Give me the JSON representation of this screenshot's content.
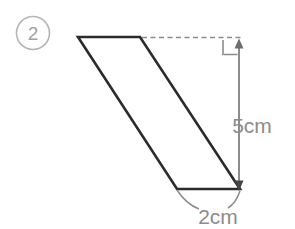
{
  "figure": {
    "problem_marker": "2",
    "shape_name": "parallelogram",
    "height_label": "5cm",
    "base_label": "2cm",
    "colors": {
      "shape_stroke": "#2b2b2b",
      "dimension_line": "#8c8c8c",
      "dashed_guide": "#8c8c8c",
      "label_text": "#8c8c8c",
      "marker_text": "#a0a0a0",
      "background": "#ffffff"
    },
    "geometry": {
      "top_left": [
        78,
        37
      ],
      "top_right": [
        140,
        37
      ],
      "bottom_right": [
        240,
        189
      ],
      "bottom_left": [
        177,
        189
      ],
      "dashed_from": [
        140,
        37
      ],
      "dashed_to": [
        240,
        37
      ],
      "dimension_arrow_top": [
        239,
        40
      ],
      "dimension_arrow_bottom": [
        239,
        189
      ],
      "right_angle_corner": [
        223,
        40
      ],
      "base_arc_from": [
        177,
        190
      ],
      "base_arc_to": [
        240,
        190
      ]
    }
  }
}
